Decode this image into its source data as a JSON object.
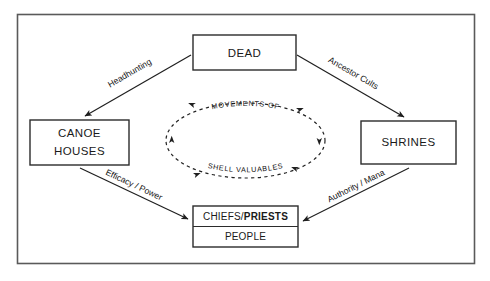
{
  "figure": {
    "type": "flow-diagram",
    "background_color": "#ffffff",
    "frame_color": "#555555",
    "line_color": "#1f1f1f",
    "text_color": "#1a1a1a"
  },
  "nodes": {
    "dead": {
      "label": "DEAD"
    },
    "canoe_houses": {
      "line1": "CANOE",
      "line2": "HOUSES"
    },
    "shrines": {
      "label": "SHRINES"
    },
    "chiefs": {
      "label_regular": "CHIEFS/",
      "label_bold": "PRIESTS"
    },
    "people": {
      "label": "PEOPLE"
    }
  },
  "edges": {
    "dead_to_canoe": {
      "label": "Headhunting"
    },
    "dead_to_shrines": {
      "label": "Ancestor Cults"
    },
    "canoe_to_chiefs": {
      "label": "Efficacy / Power"
    },
    "shrines_to_chiefs": {
      "label": "Authority / Mana"
    }
  },
  "cycle": {
    "top_label": "MOVEMENTS OF",
    "bottom_label": "SHELL VALUABLES",
    "style": "dashed-ellipse-with-arrowheads"
  }
}
